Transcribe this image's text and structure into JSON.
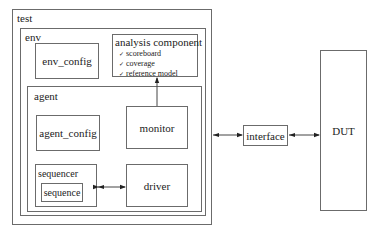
{
  "diagram": {
    "test": {
      "label": "test"
    },
    "env": {
      "label": "env"
    },
    "env_config": {
      "label": "env_config"
    },
    "analysis": {
      "label": "analysis component",
      "bullet_icon": "checkmark",
      "items": [
        {
          "label": "scoreboard"
        },
        {
          "label": "coverage"
        },
        {
          "label": "reference model"
        }
      ]
    },
    "agent": {
      "label": "agent"
    },
    "agent_config": {
      "label": "agent_config"
    },
    "monitor": {
      "label": "monitor"
    },
    "sequencer": {
      "label": "sequencer"
    },
    "sequence": {
      "label": "sequence"
    },
    "driver": {
      "label": "driver"
    },
    "interface": {
      "label": "interface"
    },
    "dut": {
      "label": "DUT"
    },
    "colors": {
      "line": "#6b6b6b",
      "arrow": "#222222",
      "background": "#ffffff"
    }
  }
}
